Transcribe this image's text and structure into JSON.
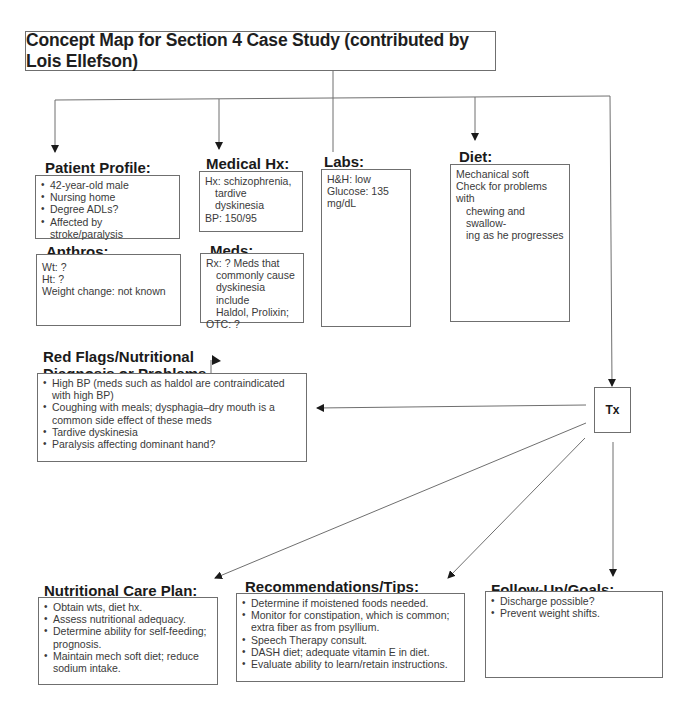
{
  "title": "Concept Map for Section 4 Case Study (contributed by Lois Ellefson)",
  "nodes": {
    "patient_profile": {
      "heading": "Patient Profile:",
      "items": [
        "42-year-old male",
        "Nursing home",
        "Degree ADLs?",
        "Affected by stroke/paralysis"
      ]
    },
    "anthros": {
      "heading": "Anthros:",
      "lines": [
        "Wt:  ?",
        "Ht:   ?",
        "Weight change: not known"
      ]
    },
    "medical_hx": {
      "heading": "Medical Hx:",
      "lines": [
        "Hx: schizophrenia,",
        "tardive dyskinesia",
        "BP:  150/95"
      ]
    },
    "meds": {
      "heading": "Meds:",
      "lines": [
        "Rx: ?   Meds that",
        "commonly cause",
        "dyskinesia include",
        "Haldol, Prolixin;",
        "OTC: ?"
      ]
    },
    "labs": {
      "heading": "Labs:",
      "lines": [
        "H&H: low",
        "Glucose: 135 mg/dL"
      ]
    },
    "diet": {
      "heading": "Diet:",
      "lines": [
        "Mechanical soft",
        "Check for problems with",
        "chewing and swallow-",
        "ing as he progresses"
      ]
    },
    "red_flags": {
      "heading_line1": "Red Flags/Nutritional",
      "heading_line2": "Diagnosis or Problems",
      "items": [
        "High BP (meds such as haldol are contraindicated with high BP)",
        "Coughing with meals; dysphagia–dry mouth is a common side effect of these meds",
        "Tardive dyskinesia",
        "Paralysis affecting dominant hand?"
      ]
    },
    "tx": {
      "label": "Tx"
    },
    "nutritional_care_plan": {
      "heading": "Nutritional Care Plan:",
      "items": [
        "Obtain wts, diet hx.",
        "Assess nutritional adequacy.",
        "Determine ability for self-feeding; prognosis.",
        "Maintain mech soft diet; reduce sodium intake."
      ]
    },
    "recommendations": {
      "heading": "Recommendations/Tips:",
      "items": [
        "Determine if moistened foods needed.",
        "Monitor for constipation, which is common; extra fiber as from psyllium.",
        "Speech Therapy consult.",
        "DASH diet; adequate vitamin E in diet.",
        "Evaluate ability to learn/retain instructions."
      ]
    },
    "follow_up": {
      "heading": "Follow-Up/Goals:",
      "items": [
        "Discharge possible?",
        "Prevent weight shifts."
      ]
    }
  },
  "colors": {
    "line": "#6f6f6f",
    "arrow": "#1a1a1a",
    "text": "#3a3a3a",
    "heading": "#1a1a1a"
  }
}
